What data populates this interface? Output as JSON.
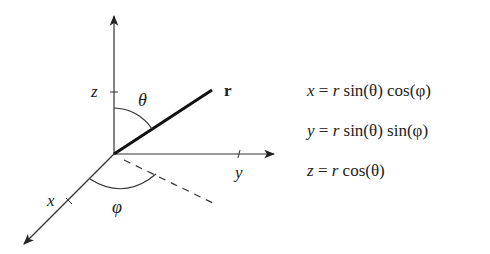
{
  "diagram": {
    "axes": {
      "z_label": "z",
      "y_label": "y",
      "x_label": "x"
    },
    "vector_label": "r",
    "polar_angle_label": "θ",
    "azimuth_angle_label": "φ",
    "colors": {
      "ink": "#222222",
      "background": "#ffffff"
    }
  },
  "equations": [
    {
      "lhs": "x",
      "op": " = ",
      "r": "r",
      "rest": " sin(θ) cos(φ)"
    },
    {
      "lhs": "y",
      "op": " = ",
      "r": "r",
      "rest": " sin(θ) sin(φ)"
    },
    {
      "lhs": "z",
      "op": " = ",
      "r": "r",
      "rest": " cos(θ)"
    }
  ]
}
